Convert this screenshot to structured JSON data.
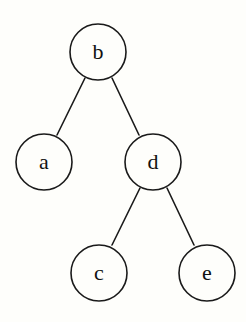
{
  "diagram": {
    "type": "binary-tree",
    "background": "#fefefb",
    "stroke_color": "#1a1a1a",
    "node_radius": 28,
    "nodes": [
      {
        "id": "b",
        "label": "b",
        "cx": 98,
        "cy": 52
      },
      {
        "id": "a",
        "label": "a",
        "cx": 44,
        "cy": 162
      },
      {
        "id": "d",
        "label": "d",
        "cx": 153,
        "cy": 162
      },
      {
        "id": "c",
        "label": "c",
        "cx": 99,
        "cy": 273
      },
      {
        "id": "e",
        "label": "e",
        "cx": 207,
        "cy": 273
      }
    ],
    "edges": [
      {
        "from": "b",
        "to": "a",
        "x1": 85,
        "y1": 78,
        "x2": 57,
        "y2": 135
      },
      {
        "from": "b",
        "to": "d",
        "x1": 112,
        "y1": 78,
        "x2": 139,
        "y2": 135
      },
      {
        "from": "d",
        "to": "c",
        "x1": 140,
        "y1": 188,
        "x2": 112,
        "y2": 245
      },
      {
        "from": "d",
        "to": "e",
        "x1": 167,
        "y1": 188,
        "x2": 194,
        "y2": 245
      }
    ]
  }
}
